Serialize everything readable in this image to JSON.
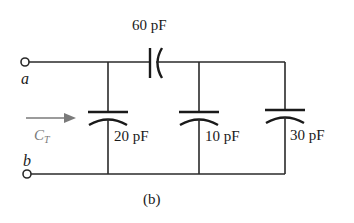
{
  "figure": {
    "caption": "(b)",
    "terminals": {
      "a": "a",
      "b": "b"
    },
    "equivalent_label": {
      "symbol": "C",
      "subscript": "T"
    },
    "series_capacitor": {
      "label": "60 pF",
      "value_pF": 60
    },
    "shunt_capacitors": [
      {
        "label": "20 pF",
        "value_pF": 20
      },
      {
        "label": "10 pF",
        "value_pF": 10
      },
      {
        "label": "30 pF",
        "value_pF": 30
      }
    ],
    "colors": {
      "wire": "#2a2a2a",
      "arrow": "#7a7a7a",
      "background": "#ffffff"
    }
  }
}
